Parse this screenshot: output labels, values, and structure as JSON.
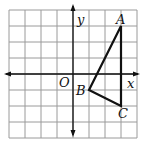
{
  "diagram": {
    "type": "coordinate-plane",
    "grid": {
      "x_min": -4,
      "x_max": 4,
      "y_min": -4,
      "y_max": 4,
      "cell_px": 16,
      "origin_px": [
        73,
        74
      ],
      "line_color": "#9a9a9a"
    },
    "axes": {
      "x_label": "x",
      "y_label": "y",
      "origin_label": "O",
      "color": "#111111"
    },
    "triangle": {
      "color": "#111111",
      "vertices": [
        {
          "label": "A",
          "x": 3,
          "y": 3
        },
        {
          "label": "B",
          "x": 1,
          "y": -1
        },
        {
          "label": "C",
          "x": 3,
          "y": -2
        }
      ]
    }
  }
}
